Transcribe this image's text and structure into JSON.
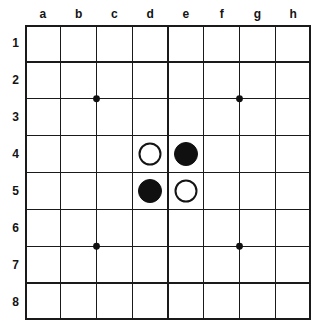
{
  "board": {
    "title": "8x8 board",
    "columns": [
      "a",
      "b",
      "c",
      "d",
      "e",
      "f",
      "g",
      "h"
    ],
    "rows": [
      "1",
      "2",
      "3",
      "4",
      "5",
      "6",
      "7",
      "8"
    ],
    "size": 8,
    "line_color": "#1a1a1a",
    "background_color": "#ffffff",
    "label_color": "#141414",
    "star_point_color": "#101010",
    "star_points": [
      {
        "name": "star-point-b2c3",
        "col_line": 2,
        "row_line": 2
      },
      {
        "name": "star-point-f2g3",
        "col_line": 6,
        "row_line": 2
      },
      {
        "name": "star-point-b6c7",
        "col_line": 2,
        "row_line": 6
      },
      {
        "name": "star-point-f6g7",
        "col_line": 6,
        "row_line": 6
      }
    ],
    "stones": [
      {
        "id": "d4",
        "col": "d",
        "row": "4",
        "color": "white",
        "label": "white stone at d4"
      },
      {
        "id": "e4",
        "col": "e",
        "row": "4",
        "color": "black",
        "label": "black stone at e4"
      },
      {
        "id": "d5",
        "col": "d",
        "row": "5",
        "color": "black",
        "label": "black stone at d5"
      },
      {
        "id": "e5",
        "col": "e",
        "row": "5",
        "color": "white",
        "label": "white stone at e5"
      }
    ],
    "stone_colors": {
      "black_fill": "#101010",
      "white_fill": "#ffffff",
      "white_outline": "#141414"
    }
  }
}
